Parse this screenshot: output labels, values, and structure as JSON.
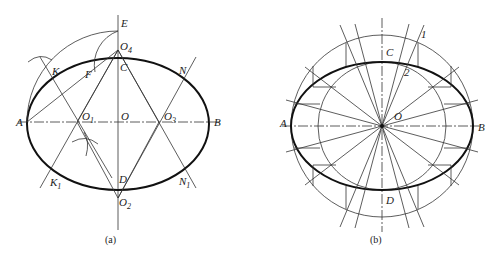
{
  "figure_a": {
    "caption": "(a)",
    "labels": {
      "E": "E",
      "O4": "O",
      "O4_sub": "4",
      "C": "C",
      "K": "K",
      "F": "F",
      "N": "N",
      "A": "A",
      "O1": "O",
      "O1_sub": "1",
      "O": "O",
      "O3": "O",
      "O3_sub": "3",
      "B": "B",
      "K1": "K",
      "K1_sub": "1",
      "D": "D",
      "N1": "N",
      "N1_sub": "1",
      "O2": "O",
      "O2_sub": "2"
    }
  },
  "figure_b": {
    "caption": "(b)",
    "labels": {
      "C": "C",
      "one": "1",
      "two": "2",
      "A": "A",
      "O": "O",
      "B": "B",
      "D": "D"
    }
  }
}
